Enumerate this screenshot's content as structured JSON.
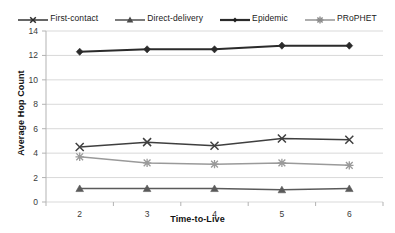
{
  "chart_data": {
    "type": "line",
    "title": "",
    "xlabel": "Time-to-Live",
    "ylabel": "Average Hop Count",
    "x": [
      2,
      3,
      4,
      5,
      6
    ],
    "xtick_labels": [
      "2",
      "3",
      "4",
      "5",
      "6"
    ],
    "ytick_labels": [
      "0",
      "2",
      "4",
      "6",
      "8",
      "10",
      "12",
      "14"
    ],
    "ylim": [
      0,
      14
    ],
    "xlim": [
      1.5,
      6.5
    ],
    "grid": "horizontal",
    "legend_position": "top-center",
    "series": [
      {
        "name": "First-contact",
        "marker": "x-cross",
        "color": "#3f3f3f",
        "values": [
          4.5,
          4.9,
          4.6,
          5.2,
          5.1
        ]
      },
      {
        "name": "Direct-delivery",
        "marker": "triangle",
        "color": "#5a5a5a",
        "values": [
          1.1,
          1.1,
          1.1,
          1.0,
          1.1
        ]
      },
      {
        "name": "Epidemic",
        "marker": "diamond",
        "color": "#2b2b2b",
        "values": [
          12.3,
          12.5,
          12.5,
          12.8,
          12.8
        ]
      },
      {
        "name": "PRoPHET",
        "marker": "asterisk",
        "color": "#9a9a9a",
        "values": [
          3.7,
          3.2,
          3.1,
          3.2,
          3.0
        ]
      }
    ]
  },
  "legend": {
    "items": [
      {
        "label": "First-contact"
      },
      {
        "label": "Direct-delivery"
      },
      {
        "label": "Epidemic"
      },
      {
        "label": "PRoPHET"
      }
    ]
  },
  "colors": {
    "grid": "#d9d9d9",
    "axis": "#b3b3b3",
    "background": "#ffffff"
  }
}
